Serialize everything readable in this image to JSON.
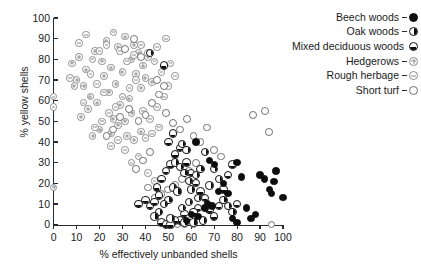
{
  "chart": {
    "type": "scatter",
    "title": "",
    "xlabel": "% effectively unbanded shells",
    "ylabel": "% yellow shells",
    "xlim": [
      0,
      100
    ],
    "ylim": [
      0,
      100
    ],
    "x_ticks": [
      "0",
      "10",
      "20",
      "30",
      "40",
      "50",
      "60",
      "70",
      "80",
      "90",
      "100"
    ],
    "y_ticks": [
      "0",
      "10",
      "20",
      "30",
      "40",
      "50",
      "60",
      "70",
      "80",
      "90",
      "100"
    ],
    "grid": false,
    "legend_position": "right"
  },
  "legend": {
    "items": [
      {
        "label": "Beech woods",
        "marker": "filled-circle-icon",
        "key": "beech",
        "color": "#0d0d0d"
      },
      {
        "label": "Oak woods",
        "marker": "right-half-filled-circle-icon",
        "key": "oak",
        "color": "#0d0d0d"
      },
      {
        "label": "Mixed deciduous woods",
        "marker": "bottom-half-filled-circle-icon",
        "key": "mixed",
        "color": "#0d0d0d"
      },
      {
        "label": "Hedgerows",
        "marker": "circle-plus-icon",
        "key": "hedge",
        "color": "#8d8d8d"
      },
      {
        "label": "Rough herbage",
        "marker": "circle-dash-icon",
        "key": "rough",
        "color": "#8d8d8d"
      },
      {
        "label": "Short turf",
        "marker": "open-circle-icon",
        "key": "short",
        "color": "#6e6e6e"
      }
    ]
  },
  "chart_data": {
    "type": "scatter",
    "title": "",
    "xlabel": "% effectively unbanded shells",
    "ylabel": "% yellow shells",
    "xlim": [
      0,
      100
    ],
    "ylim": [
      0,
      100
    ],
    "x_ticks": [
      0,
      10,
      20,
      30,
      40,
      50,
      60,
      70,
      80,
      90,
      100
    ],
    "y_ticks": [
      0,
      10,
      20,
      30,
      40,
      50,
      60,
      70,
      80,
      90,
      100
    ],
    "grid": false,
    "legend_position": "right",
    "series": [
      {
        "name": "Beech woods",
        "key": "beech",
        "marker": "filled-circle",
        "points": [
          [
            62,
            40
          ],
          [
            68,
            31
          ],
          [
            70,
            29
          ],
          [
            74,
            20
          ],
          [
            72,
            16
          ],
          [
            76,
            15
          ],
          [
            67,
            10
          ],
          [
            69,
            9
          ],
          [
            66,
            8
          ],
          [
            60,
            5
          ],
          [
            63,
            4
          ],
          [
            58,
            2
          ],
          [
            78,
            3
          ],
          [
            80,
            1
          ],
          [
            82,
            23
          ],
          [
            80,
            30
          ],
          [
            90,
            24
          ],
          [
            92,
            22
          ],
          [
            94,
            17
          ],
          [
            95,
            15
          ],
          [
            88,
            5
          ],
          [
            86,
            3
          ],
          [
            84,
            8
          ],
          [
            100,
            13
          ],
          [
            96,
            21
          ],
          [
            97,
            26
          ]
        ]
      },
      {
        "name": "Oak woods",
        "key": "oak",
        "marker": "right-half-filled-circle",
        "points": [
          [
            42,
            83
          ],
          [
            56,
            39
          ],
          [
            58,
            36
          ],
          [
            53,
            30
          ],
          [
            55,
            28
          ],
          [
            57,
            25
          ],
          [
            59,
            21
          ],
          [
            52,
            18
          ],
          [
            54,
            16
          ],
          [
            50,
            12
          ],
          [
            48,
            10
          ],
          [
            56,
            8
          ],
          [
            46,
            6
          ],
          [
            44,
            4
          ],
          [
            60,
            17
          ],
          [
            62,
            24
          ],
          [
            64,
            27
          ],
          [
            66,
            35
          ],
          [
            70,
            27
          ],
          [
            72,
            22
          ],
          [
            68,
            19
          ],
          [
            74,
            12
          ],
          [
            76,
            9
          ],
          [
            78,
            6
          ],
          [
            57,
            1
          ],
          [
            61,
            1
          ],
          [
            65,
            2
          ],
          [
            51,
            3
          ],
          [
            59,
            11
          ],
          [
            63,
            13
          ]
        ]
      },
      {
        "name": "Mixed deciduous woods",
        "key": "mixed",
        "marker": "bottom-half-filled-circle",
        "points": [
          [
            48,
            77
          ],
          [
            37,
            10
          ],
          [
            40,
            12
          ],
          [
            42,
            9
          ],
          [
            44,
            11
          ],
          [
            46,
            14
          ],
          [
            45,
            18
          ],
          [
            47,
            22
          ],
          [
            49,
            26
          ],
          [
            51,
            29
          ],
          [
            53,
            34
          ],
          [
            55,
            37
          ],
          [
            50,
            40
          ],
          [
            52,
            44
          ],
          [
            58,
            30
          ],
          [
            60,
            25
          ],
          [
            62,
            20
          ],
          [
            64,
            16
          ],
          [
            66,
            13
          ],
          [
            68,
            7
          ],
          [
            70,
            4
          ],
          [
            63,
            8
          ],
          [
            61,
            6
          ],
          [
            57,
            5
          ],
          [
            59,
            3
          ],
          [
            55,
            2
          ],
          [
            53,
            2
          ],
          [
            72,
            9
          ],
          [
            74,
            17
          ],
          [
            76,
            24
          ],
          [
            78,
            29
          ],
          [
            80,
            10
          ],
          [
            47,
            1
          ],
          [
            49,
            0
          ],
          [
            51,
            0
          ]
        ]
      },
      {
        "name": "Hedgerows",
        "key": "hedge",
        "marker": "circle-plus",
        "points": [
          [
            0,
            18
          ],
          [
            8,
            78
          ],
          [
            10,
            70
          ],
          [
            13,
            67
          ],
          [
            16,
            62
          ],
          [
            19,
            59
          ],
          [
            22,
            72
          ],
          [
            25,
            76
          ],
          [
            28,
            86
          ],
          [
            31,
            91
          ],
          [
            34,
            80
          ],
          [
            30,
            74
          ],
          [
            27,
            68
          ],
          [
            24,
            64
          ],
          [
            21,
            79
          ],
          [
            18,
            84
          ],
          [
            15,
            56
          ],
          [
            12,
            52
          ],
          [
            26,
            51
          ],
          [
            29,
            58
          ],
          [
            33,
            61
          ],
          [
            36,
            73
          ],
          [
            39,
            77
          ],
          [
            41,
            81
          ],
          [
            37,
            83
          ],
          [
            35,
            87
          ],
          [
            23,
            89
          ],
          [
            20,
            46
          ],
          [
            17,
            43
          ],
          [
            25,
            44
          ],
          [
            28,
            48
          ],
          [
            31,
            50
          ],
          [
            34,
            54
          ],
          [
            14,
            75
          ],
          [
            11,
            81
          ],
          [
            9,
            67
          ],
          [
            38,
            66
          ],
          [
            40,
            71
          ],
          [
            43,
            69
          ],
          [
            32,
            43
          ],
          [
            35,
            41
          ],
          [
            38,
            45
          ]
        ]
      },
      {
        "name": "Rough herbage",
        "key": "rough",
        "marker": "circle-dash",
        "points": [
          [
            0,
            62
          ],
          [
            0,
            57
          ],
          [
            7,
            71
          ],
          [
            11,
            88
          ],
          [
            14,
            92
          ],
          [
            17,
            80
          ],
          [
            20,
            84
          ],
          [
            23,
            87
          ],
          [
            26,
            93
          ],
          [
            29,
            84
          ],
          [
            32,
            79
          ],
          [
            35,
            82
          ],
          [
            38,
            87
          ],
          [
            41,
            83
          ],
          [
            44,
            79
          ],
          [
            47,
            74
          ],
          [
            36,
            70
          ],
          [
            33,
            66
          ],
          [
            30,
            62
          ],
          [
            27,
            57
          ],
          [
            24,
            54
          ],
          [
            21,
            50
          ],
          [
            18,
            47
          ],
          [
            39,
            55
          ],
          [
            42,
            51
          ],
          [
            45,
            57
          ],
          [
            48,
            62
          ],
          [
            50,
            67
          ],
          [
            43,
            44
          ],
          [
            40,
            42
          ],
          [
            46,
            47
          ],
          [
            31,
            36
          ],
          [
            37,
            33
          ],
          [
            34,
            30
          ],
          [
            28,
            41
          ],
          [
            25,
            38
          ],
          [
            13,
            59
          ],
          [
            16,
            73
          ],
          [
            19,
            68
          ],
          [
            22,
            64
          ],
          [
            45,
            86
          ],
          [
            49,
            90
          ],
          [
            51,
            78
          ],
          [
            53,
            72
          ],
          [
            44,
            21
          ],
          [
            41,
            25
          ]
        ]
      },
      {
        "name": "Short turf",
        "key": "short",
        "marker": "open-circle",
        "points": [
          [
            31,
            85
          ],
          [
            35,
            90
          ],
          [
            38,
            81
          ],
          [
            33,
            56
          ],
          [
            29,
            52
          ],
          [
            26,
            46
          ],
          [
            23,
            43
          ],
          [
            37,
            50
          ],
          [
            40,
            53
          ],
          [
            43,
            59
          ],
          [
            46,
            63
          ],
          [
            49,
            54
          ],
          [
            52,
            49
          ],
          [
            55,
            46
          ],
          [
            58,
            51
          ],
          [
            61,
            43
          ],
          [
            64,
            40
          ],
          [
            67,
            47
          ],
          [
            70,
            36
          ],
          [
            73,
            33
          ],
          [
            62,
            30
          ],
          [
            59,
            26
          ],
          [
            56,
            22
          ],
          [
            53,
            19
          ],
          [
            50,
            17
          ],
          [
            47,
            15
          ],
          [
            44,
            13
          ],
          [
            41,
            18
          ],
          [
            87,
            53
          ],
          [
            92,
            55
          ],
          [
            94,
            45
          ],
          [
            95,
            0
          ],
          [
            57,
            0
          ],
          [
            61,
            0
          ],
          [
            50,
            0
          ],
          [
            54,
            0
          ],
          [
            48,
            67
          ],
          [
            45,
            70
          ],
          [
            42,
            35
          ],
          [
            39,
            31
          ],
          [
            36,
            27
          ]
        ]
      }
    ]
  }
}
